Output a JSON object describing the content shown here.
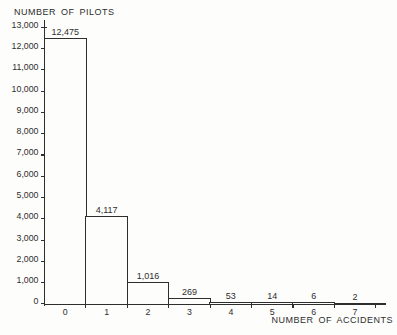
{
  "chart_data": {
    "type": "bar",
    "ylabel": "NUMBER OF PILOTS",
    "xlabel": "NUMBER OF ACCIDENTS",
    "categories": [
      "0",
      "1",
      "2",
      "3",
      "4",
      "5",
      "6",
      "7"
    ],
    "values": [
      12475,
      4117,
      1016,
      269,
      53,
      14,
      6,
      2
    ],
    "bar_value_labels": [
      "12,475",
      "4,117",
      "1,016",
      "269",
      "53",
      "14",
      "6",
      "2"
    ],
    "y_tick_labels": [
      "0",
      "1,000",
      "2,000",
      "3,000",
      "4,000",
      "5,000",
      "6,000",
      "7,000",
      "8,000",
      "9,000",
      "10,000",
      "11,000",
      "12,000",
      "13,000"
    ],
    "y_tick_step": 1000,
    "ylim": [
      0,
      13000
    ],
    "grid": false,
    "legend_position": "none",
    "colors": {
      "line": "#2e2e2e",
      "text": "#2e2e2e",
      "bar_fill": "#fdfdfb",
      "background": "#fdfdfb"
    }
  }
}
